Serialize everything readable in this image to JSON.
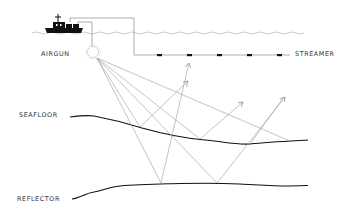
{
  "diagram": {
    "type": "marine seismic survey schematic",
    "labels": {
      "airgun": "AIRGUN",
      "streamer": "STREAMER",
      "seafloor": "SEAFLOOR",
      "reflector": "REFLECTOR"
    },
    "colors": {
      "ink": "#111111",
      "ray": "#9a9a9a",
      "water": "#aaaaaa",
      "cable": "#777777",
      "text": "#333333"
    },
    "elements": {
      "ship": "survey-vessel",
      "airgun_source": "starburst-circle",
      "receivers_count": 5,
      "rays_from_source": 5
    }
  }
}
